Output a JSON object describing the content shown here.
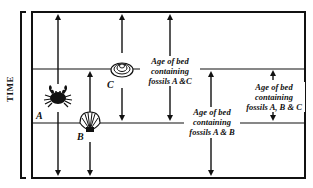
{
  "diagram": {
    "axis_label": "TIME",
    "fossils": [
      {
        "letter": "A",
        "organism": "crab"
      },
      {
        "letter": "B",
        "organism": "scallop shell"
      },
      {
        "letter": "C",
        "organism": "clam shell"
      }
    ],
    "labels": {
      "a_and_c": {
        "line1": "Age of bed",
        "line2": "containing",
        "line3": "fossils A &C"
      },
      "a_and_b": {
        "line1": "Age of bed",
        "line2": "containing",
        "line3": "fossils A & B"
      },
      "a_b_and_c": {
        "line1": "Age of bed",
        "line2": "containing",
        "line3": "fossils A, B & C"
      }
    },
    "colors": {
      "line": "#111111",
      "background": "#ffffff"
    }
  }
}
